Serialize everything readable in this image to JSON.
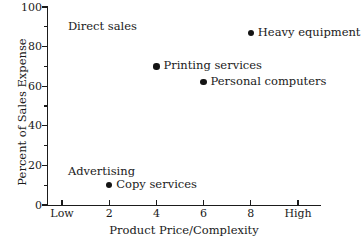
{
  "chart_data": {
    "type": "scatter",
    "title": "",
    "xlabel": "Product Price/Complexity",
    "ylabel": "Percent of Sales Expense",
    "xlim": [
      0,
      10
    ],
    "ylim": [
      0,
      100
    ],
    "grid": false,
    "legend": "none",
    "x_ticks": [
      {
        "value": 0,
        "label": "Low"
      },
      {
        "value": 2,
        "label": "2"
      },
      {
        "value": 4,
        "label": "4"
      },
      {
        "value": 6,
        "label": "6"
      },
      {
        "value": 8,
        "label": "8"
      },
      {
        "value": 10,
        "label": "High"
      }
    ],
    "y_ticks": [
      {
        "value": 0,
        "label": "0",
        "major": true
      },
      {
        "value": 10,
        "label": "",
        "major": false
      },
      {
        "value": 20,
        "label": "20",
        "major": true
      },
      {
        "value": 30,
        "label": "",
        "major": false
      },
      {
        "value": 40,
        "label": "40",
        "major": true
      },
      {
        "value": 50,
        "label": "",
        "major": false
      },
      {
        "value": 60,
        "label": "60",
        "major": true
      },
      {
        "value": 70,
        "label": "",
        "major": false
      },
      {
        "value": 80,
        "label": "80",
        "major": true
      },
      {
        "value": 90,
        "label": "",
        "major": false
      },
      {
        "value": 100,
        "label": "100",
        "major": true
      }
    ],
    "points": [
      {
        "label": "Heavy equipment",
        "x": 8,
        "y": 87
      },
      {
        "label": "Printing services",
        "x": 4,
        "y": 70
      },
      {
        "label": "Personal computers",
        "x": 6,
        "y": 62
      },
      {
        "label": "Copy services",
        "x": 2,
        "y": 10
      }
    ],
    "annotations": [
      {
        "text": "Direct sales",
        "x": 0.25,
        "y": 90
      },
      {
        "text": "Advertising",
        "x": 0.25,
        "y": 17
      }
    ]
  }
}
